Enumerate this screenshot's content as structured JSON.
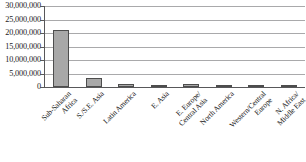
{
  "chart_data": {
    "type": "bar",
    "title": "",
    "xlabel": "",
    "ylabel": "",
    "categories": [
      "Sub-Saharan\nAfrica",
      "S./S.E. Asia",
      "Latin America",
      "E. Asia",
      "E. Europe/\nCentral Asia",
      "North America",
      "Western/Central\nEurope",
      "N. Africa/\nMiddle East"
    ],
    "values": [
      21000000,
      3500000,
      1200000,
      700000,
      1000000,
      900000,
      700000,
      400000
    ],
    "ylim": [
      0,
      30000000
    ],
    "ytick_values": [
      0,
      5000000,
      10000000,
      15000000,
      20000000,
      25000000,
      30000000
    ],
    "ytick_labels": [
      "0",
      "5,000,000",
      "10,000,000",
      "15,000,000",
      "20,000,000",
      "25,000,000",
      "30,000,000"
    ],
    "grid": true,
    "legend": false,
    "series_color": "#a8a8a8",
    "series_border_color": "#4d4d4d",
    "gridline_color": "#a9a9ab",
    "axis_color": "#58585a"
  }
}
